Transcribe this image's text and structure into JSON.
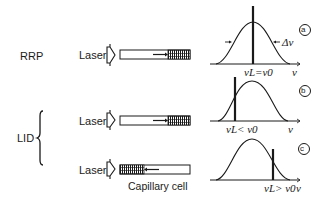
{
  "labels": {
    "rrp": "RRP",
    "lid": "LID",
    "laser": "Laser",
    "capillary_cell": "Capillary cell"
  },
  "panels": [
    {
      "id": "a",
      "badge": "a",
      "laser_label": "νL=ν0",
      "linewidth_label": "Δν",
      "axis_label": "ν",
      "condition": "laser tuned to line center",
      "deposit_position": "right (far end)",
      "flow_arrow": "right"
    },
    {
      "id": "b",
      "badge": "b",
      "laser_label": "νL< ν0",
      "axis_label": "ν",
      "condition": "laser below line center",
      "deposit_position": "right (far end)",
      "flow_arrow": "right"
    },
    {
      "id": "c",
      "badge": "c",
      "laser_label": "νL> ν0",
      "axis_label": "ν",
      "condition": "laser above line center",
      "deposit_position": "left (near laser)",
      "flow_arrow": "left"
    }
  ],
  "colors": {
    "ink": "#1a1a1a",
    "background": "#ffffff"
  }
}
